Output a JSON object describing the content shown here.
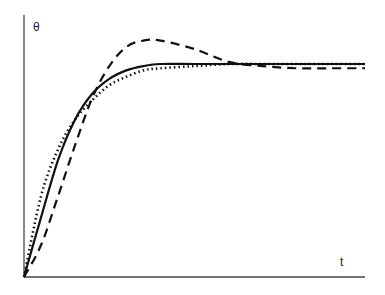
{
  "chart_data": {
    "type": "line",
    "title": "",
    "xlabel": "t",
    "ylabel": "θ",
    "xlim": [
      0,
      10
    ],
    "ylim": [
      0,
      1.25
    ],
    "grid": false,
    "legend": null,
    "x": [
      0,
      0.5,
      1,
      1.5,
      2,
      2.5,
      3,
      3.5,
      4,
      5,
      6,
      7,
      8,
      9,
      10
    ],
    "series": [
      {
        "name": "solid",
        "style": "solid",
        "values": [
          0,
          0.28,
          0.55,
          0.74,
          0.86,
          0.93,
          0.97,
          0.99,
          1.0,
          1.0,
          1.0,
          1.0,
          1.0,
          1.0,
          1.0
        ]
      },
      {
        "name": "dashed",
        "style": "dashed",
        "values": [
          0,
          0.15,
          0.38,
          0.62,
          0.84,
          0.99,
          1.08,
          1.11,
          1.11,
          1.07,
          1.01,
          0.99,
          0.98,
          0.98,
          0.98
        ]
      },
      {
        "name": "dotted",
        "style": "dotted",
        "values": [
          0,
          0.38,
          0.6,
          0.74,
          0.83,
          0.9,
          0.94,
          0.97,
          0.98,
          0.99,
          1.0,
          1.0,
          1.0,
          1.0,
          1.0
        ]
      }
    ]
  },
  "labels": {
    "y_axis": "θ",
    "x_axis": "t"
  }
}
